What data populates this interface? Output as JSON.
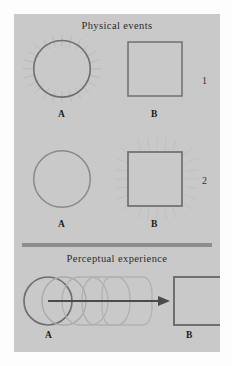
{
  "figure": {
    "sections": [
      {
        "key": "physical",
        "title": "Physical events"
      },
      {
        "key": "perceptual",
        "title": "Perceptual experience"
      }
    ],
    "row_numbers": [
      "1",
      "2"
    ],
    "labels": {
      "a": "A",
      "b": "B"
    },
    "rows": [
      {
        "number": "1",
        "left_shape": "circle",
        "left_label": "A",
        "left_flashing": true,
        "right_shape": "square",
        "right_label": "B",
        "right_flashing": false
      },
      {
        "number": "2",
        "left_shape": "circle",
        "left_label": "A",
        "left_flashing": false,
        "right_shape": "square",
        "right_label": "B",
        "right_flashing": true
      },
      {
        "number": "",
        "left_shape": "circle",
        "left_label": "A",
        "morph_steps": 5,
        "arrow": "rightward-motion-arrow",
        "right_shape": "square",
        "right_label": "B"
      }
    ],
    "colors": {
      "page_background": "#fdfdfd",
      "panel_background": "#c9c9c9",
      "stroke_dark": "#6b6b6b",
      "stroke_light": "#a8a8a8",
      "ray_stroke": "#b6b6b6",
      "divider": "#8d8d8d",
      "text": "#2b2b2b",
      "arrow": "#4a4a4a"
    }
  }
}
